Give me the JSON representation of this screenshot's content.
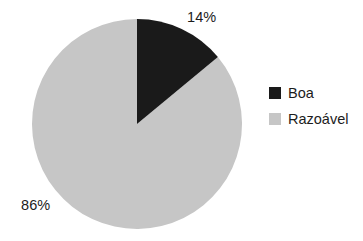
{
  "chart_data": {
    "type": "pie",
    "title": "",
    "subtitle": "",
    "xlabel": "",
    "ylabel": "",
    "grid": false,
    "legend_position": "right",
    "start_angle_deg": 0,
    "direction": "clockwise",
    "categories": [
      "Boa",
      "Razoável"
    ],
    "values": [
      14,
      86
    ],
    "unit": "%",
    "slices": [
      {
        "label": "Boa",
        "value": 14,
        "display": "14%",
        "color": "#1a1a1a",
        "start_deg": 0,
        "end_deg": 50.4
      },
      {
        "label": "Razoável",
        "value": 86,
        "display": "86%",
        "color": "#c6c6c6",
        "start_deg": 50.4,
        "end_deg": 360
      }
    ],
    "data_labels": [
      "14%",
      "86%"
    ],
    "annotations": []
  },
  "labels": {
    "boa_percent": "14%",
    "razoavel_percent": "86%"
  },
  "legend": {
    "items": [
      {
        "label": "Boa",
        "color": "#1a1a1a"
      },
      {
        "label": "Razoável",
        "color": "#c6c6c6"
      }
    ]
  },
  "colors": {
    "background": "#ffffff",
    "boa": "#1a1a1a",
    "razoavel": "#c6c6c6",
    "text": "#1c1c1c"
  },
  "geometry": {
    "center_x": 137,
    "center_y": 124,
    "radius": 105
  }
}
